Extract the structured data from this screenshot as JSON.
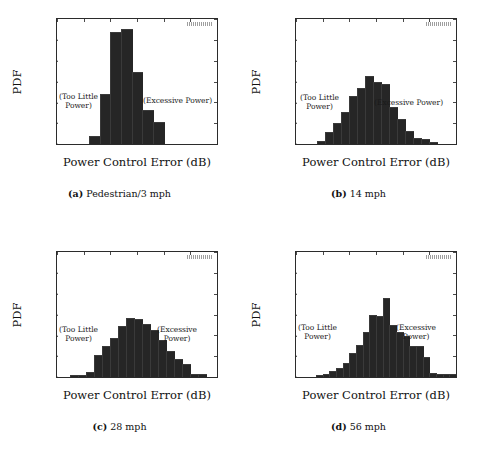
{
  "figure": {
    "panels": [
      {
        "id": "a",
        "tag": "(a)",
        "caption_text": "Pedestrian/3 mph",
        "corner_mark": "illegible-small-label",
        "annot_left": "(Too Little\nPower)",
        "annot_right": "(Excessive Power)",
        "chart_data": {
          "type": "bar",
          "title": "(a) Pedestrian/3 mph",
          "xlabel": "Power Control Error (dB)",
          "ylabel": "PDF",
          "xlim": [
            -20,
            40
          ],
          "ylim": [
            0,
            0.3
          ],
          "xticks": [
            -20,
            -10,
            0,
            10,
            20,
            30,
            40
          ],
          "yticks": [
            0.0,
            0.05,
            0.1,
            0.15,
            0.2,
            0.25,
            0.3
          ],
          "ytick_labels": [
            "0.0",
            "0.05",
            "0.1",
            "0.15",
            "0.2",
            "0.25",
            "0.3"
          ],
          "grid": false,
          "bin_width": 4,
          "bin_left_edges": [
            -12,
            -8,
            -4,
            0,
            4,
            8,
            12,
            16
          ],
          "bin_centers": [
            -10,
            -6,
            -2,
            2,
            6,
            10,
            14,
            18
          ],
          "values": [
            0.0,
            0.017,
            0.118,
            0.266,
            0.273,
            0.171,
            0.079,
            0.05
          ]
        }
      },
      {
        "id": "b",
        "tag": "(b)",
        "caption_text": "14 mph",
        "corner_mark": "illegible-small-label",
        "annot_left": "(Too Little\nPower)",
        "annot_right": "(Excessive Power)",
        "chart_data": {
          "type": "bar",
          "title": "(b) 14 mph",
          "xlabel": "Power Control Error (dB)",
          "ylabel": "PDF",
          "xlim": [
            -20,
            40
          ],
          "ylim": [
            0,
            0.3
          ],
          "xticks": [
            -20,
            -10,
            0,
            10,
            20,
            30,
            40
          ],
          "yticks": [
            0.0,
            0.05,
            0.1,
            0.15,
            0.2,
            0.25,
            0.3
          ],
          "ytick_labels": [
            "0.0",
            "0.05",
            "0.1",
            "0.15",
            "0.2",
            "0.25",
            "0.3"
          ],
          "grid": false,
          "bin_width": 3,
          "bin_left_edges": [
            -12,
            -9,
            -6,
            -3,
            0,
            3,
            6,
            9,
            12,
            15,
            18,
            21,
            24,
            27,
            30
          ],
          "bin_centers": [
            -10.5,
            -7.5,
            -4.5,
            -1.5,
            1.5,
            4.5,
            7.5,
            10.5,
            13.5,
            16.5,
            19.5,
            22.5,
            25.5,
            28.5,
            31.5
          ],
          "values": [
            0.004,
            0.027,
            0.048,
            0.075,
            0.113,
            0.133,
            0.161,
            0.146,
            0.142,
            0.086,
            0.058,
            0.03,
            0.013,
            0.009,
            0.003
          ]
        }
      },
      {
        "id": "c",
        "tag": "(c)",
        "caption_text": "28 mph",
        "corner_mark": "illegible-small-label",
        "annot_left": "(Too Little\nPower)",
        "annot_right": "(Excessive\nPower)",
        "chart_data": {
          "type": "bar",
          "title": "(c) 28 mph",
          "xlabel": "Power Control Error (dB)",
          "ylabel": "PDF",
          "xlim": [
            -20,
            40
          ],
          "ylim": [
            0,
            0.3
          ],
          "xticks": [
            -20,
            -10,
            0,
            10,
            20,
            30,
            40
          ],
          "yticks": [
            0.0,
            0.05,
            0.1,
            0.15,
            0.2,
            0.25,
            0.3
          ],
          "ytick_labels": [
            "0.0",
            "0.05",
            "0.1",
            "0.15",
            "0.2",
            "0.25",
            "0.3"
          ],
          "grid": false,
          "bin_width": 3,
          "bin_left_edges": [
            -15,
            -12,
            -9,
            -6,
            -3,
            0,
            3,
            6,
            9,
            12,
            15,
            18,
            21,
            24,
            27,
            30,
            33
          ],
          "bin_centers": [
            -13.5,
            -10.5,
            -7.5,
            -4.5,
            -1.5,
            1.5,
            4.5,
            7.5,
            10.5,
            13.5,
            16.5,
            19.5,
            22.5,
            25.5,
            28.5,
            31.5,
            34.5
          ],
          "values": [
            0.002,
            0.003,
            0.01,
            0.05,
            0.072,
            0.092,
            0.119,
            0.14,
            0.138,
            0.126,
            0.11,
            0.087,
            0.06,
            0.041,
            0.03,
            0.006,
            0.004
          ]
        }
      },
      {
        "id": "d",
        "tag": "(d)",
        "caption_text": "56 mph",
        "corner_mark": "illegible-small-label",
        "annot_left": "(Too Little\nPower)",
        "annot_right": "(Excessive\nPower)",
        "chart_data": {
          "type": "bar",
          "title": "(d) 56 mph",
          "xlabel": "Power Control Error (dB)",
          "ylabel": "PDF",
          "xlim": [
            -20,
            40
          ],
          "ylim": [
            0,
            0.3
          ],
          "xticks": [
            -20,
            -10,
            0,
            10,
            20,
            30,
            40
          ],
          "yticks": [
            0.0,
            0.05,
            0.1,
            0.15,
            0.2,
            0.25,
            0.3
          ],
          "ytick_labels": [
            "0.0",
            "0.05",
            "0.1",
            "0.15",
            "0.2",
            "0.25",
            "0.3"
          ],
          "grid": false,
          "bin_width": 2.5,
          "bin_left_edges": [
            -12.5,
            -10,
            -7.5,
            -5,
            -2.5,
            0,
            2.5,
            5,
            7.5,
            10,
            12.5,
            15,
            17.5,
            20,
            22.5,
            25,
            27.5,
            30,
            32.5,
            35,
            37.5
          ],
          "bin_centers": [
            -11.25,
            -8.75,
            -6.25,
            -3.75,
            -1.25,
            1.25,
            3.75,
            6.25,
            8.75,
            11.25,
            13.75,
            16.25,
            18.75,
            21.25,
            23.75,
            26.25,
            28.75,
            31.25,
            33.75,
            36.25,
            38.75
          ],
          "values": [
            0.003,
            0.006,
            0.012,
            0.02,
            0.032,
            0.055,
            0.075,
            0.105,
            0.146,
            0.145,
            0.188,
            0.122,
            0.105,
            0.095,
            0.073,
            0.072,
            0.045,
            0.008,
            0.006,
            0.004,
            0.006
          ]
        }
      }
    ]
  }
}
